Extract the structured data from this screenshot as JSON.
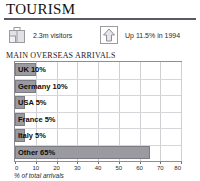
{
  "panel": {
    "title": "TOURISM",
    "section_header": "MAIN OVERSEAS ARRIVALS"
  },
  "stats": [
    {
      "icon": "suitcase-icon",
      "text": "2.3m visitors"
    },
    {
      "icon": "up-arrow-icon",
      "text": "Up 11.5% in 1994"
    }
  ],
  "colors": {
    "bar_fill": "#9a9aa0",
    "bar_stroke": "#7c7c84",
    "plot_border": "#8d8d95",
    "gridline": "#cfcfd4",
    "title_rule": "#5a5a66",
    "icon_stroke": "#8e8e96",
    "icon_fill": "#dcdce0"
  },
  "chart_data": {
    "type": "bar",
    "orientation": "horizontal",
    "title": "MAIN OVERSEAS ARRIVALS",
    "xlabel": "% of total arrivals",
    "ylabel": "",
    "categories": [
      "UK",
      "Germany",
      "USA",
      "France",
      "Italy",
      "Other"
    ],
    "values": [
      10,
      10,
      5,
      5,
      5,
      65
    ],
    "bar_labels": [
      "UK 10%",
      "Germany 10%",
      "USA 5%",
      "France 5%",
      "Italy 5%",
      "Other 65%"
    ],
    "xlim": [
      0,
      80
    ],
    "xticks": [
      0,
      10,
      20,
      30,
      40,
      50,
      60,
      70,
      80
    ],
    "xtick_labels": [
      "0",
      "10",
      "20",
      "30",
      "40",
      "50",
      "60",
      "70",
      "80"
    ],
    "grid": true,
    "grid_axis": "x",
    "legend": false
  }
}
